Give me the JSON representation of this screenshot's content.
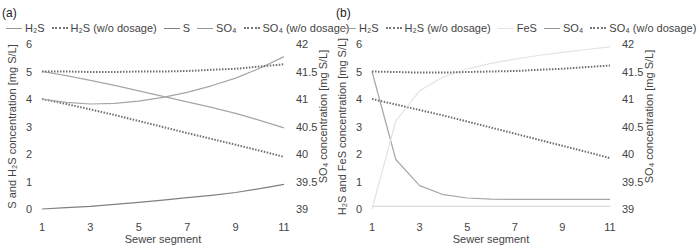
{
  "chart_data": [
    {
      "panel": "(a)",
      "type": "line",
      "legend": [
        "H2S",
        "H2S (w/o dosage)",
        "S",
        "SO4",
        "SO4 (w/o dosage)"
      ],
      "xlabel": "Sewer segment",
      "ylabel_left": "S and H2S concentration [mg S/L]",
      "ylabel_right": "SO4 concentration [mg S/L]",
      "x_ticks": [
        1,
        3,
        5,
        7,
        9,
        11
      ],
      "y_left_ticks": [
        0,
        1,
        2,
        3,
        4,
        5,
        6
      ],
      "y_right_ticks": [
        39,
        39.5,
        40,
        40.5,
        41,
        41.5,
        42
      ],
      "ylim_left": [
        0,
        6
      ],
      "ylim_right": [
        39,
        42
      ],
      "x": [
        1,
        2,
        3,
        4,
        5,
        6,
        7,
        8,
        9,
        10,
        11
      ],
      "series": [
        {
          "name": "H2S",
          "axis": "left",
          "style": "solid",
          "color": "#a6a6a6",
          "values": [
            5.0,
            4.85,
            4.68,
            4.5,
            4.3,
            4.1,
            3.9,
            3.7,
            3.48,
            3.22,
            2.95
          ]
        },
        {
          "name": "H2S (w/o dosage)",
          "axis": "left",
          "style": "dotted",
          "color": "#6e6e6e",
          "values": [
            4.0,
            3.82,
            3.62,
            3.42,
            3.2,
            2.98,
            2.76,
            2.55,
            2.34,
            2.12,
            1.9
          ]
        },
        {
          "name": "S",
          "axis": "left",
          "style": "solid",
          "color": "#7f7f7f",
          "values": [
            0.0,
            0.05,
            0.1,
            0.17,
            0.24,
            0.32,
            0.41,
            0.5,
            0.6,
            0.74,
            0.9
          ]
        },
        {
          "name": "SO4",
          "axis": "right",
          "style": "solid",
          "color": "#a6a6a6",
          "values": [
            41.0,
            40.94,
            40.91,
            40.92,
            40.96,
            41.03,
            41.12,
            41.24,
            41.38,
            41.56,
            41.77
          ]
        },
        {
          "name": "SO4 (w/o dosage)",
          "axis": "right",
          "style": "dotted",
          "color": "#6e6e6e",
          "values": [
            41.5,
            41.5,
            41.49,
            41.49,
            41.5,
            41.5,
            41.51,
            41.53,
            41.55,
            41.59,
            41.63
          ]
        }
      ]
    },
    {
      "panel": "(b)",
      "type": "line",
      "legend": [
        "H2S",
        "H2S (w/o dosage)",
        "FeS",
        "SO4",
        "SO4 (w/o dosage)"
      ],
      "xlabel": "Sewer segment",
      "ylabel_left": "H2S and FeS concentration [mg S/L]",
      "ylabel_right": "SO4 concentration [mg S/L]",
      "x_ticks": [
        1,
        3,
        5,
        7,
        9,
        11
      ],
      "y_left_ticks": [
        0,
        1,
        2,
        3,
        4,
        5,
        6
      ],
      "y_right_ticks": [
        39,
        39.5,
        40,
        40.5,
        41,
        41.5,
        42
      ],
      "ylim_left": [
        0,
        6
      ],
      "ylim_right": [
        39,
        42
      ],
      "x": [
        1,
        2,
        3,
        4,
        5,
        6,
        7,
        8,
        9,
        10,
        11
      ],
      "series": [
        {
          "name": "H2S",
          "axis": "left",
          "style": "solid",
          "color": "#a6a6a6",
          "values": [
            5.0,
            1.8,
            0.85,
            0.52,
            0.4,
            0.36,
            0.35,
            0.35,
            0.35,
            0.35,
            0.35
          ]
        },
        {
          "name": "H2S (w/o dosage)",
          "axis": "left",
          "style": "dotted",
          "color": "#6e6e6e",
          "values": [
            4.0,
            3.8,
            3.6,
            3.4,
            3.18,
            2.96,
            2.74,
            2.52,
            2.3,
            2.08,
            1.85
          ]
        },
        {
          "name": "FeS",
          "axis": "left",
          "style": "solid",
          "color": "#e3e3e3",
          "values": [
            0.0,
            3.2,
            4.3,
            4.8,
            5.1,
            5.3,
            5.45,
            5.58,
            5.7,
            5.8,
            5.9
          ]
        },
        {
          "name": "SO4",
          "axis": "right",
          "style": "solid",
          "color": "#d9d9d9",
          "values": [
            39.05,
            39.05,
            39.05,
            39.05,
            39.05,
            39.05,
            39.05,
            39.05,
            39.05,
            39.05,
            39.05
          ]
        },
        {
          "name": "SO4 (w/o dosage)",
          "axis": "right",
          "style": "dotted",
          "color": "#6e6e6e",
          "values": [
            41.5,
            41.49,
            41.48,
            41.48,
            41.49,
            41.5,
            41.51,
            41.53,
            41.55,
            41.58,
            41.61
          ]
        }
      ]
    }
  ],
  "panels": [
    {
      "label": "(a)",
      "legend": [
        {
          "text": "H₂S",
          "style": "solid"
        },
        {
          "text": "H₂S (w/o dosage)",
          "style": "dotted"
        },
        {
          "text": "S",
          "style": "solid"
        },
        {
          "text": "SO₄",
          "style": "solid"
        },
        {
          "text": "SO₄ (w/o dosage)",
          "style": "dotted"
        }
      ],
      "xlabel": "Sewer segment",
      "ylabel_left": "S and H₂S concentration [mg S/L]",
      "ylabel_right": "SO₄ concentration [mg S/L]"
    },
    {
      "label": "(b)",
      "legend": [
        {
          "text": "H₂S",
          "style": "solid"
        },
        {
          "text": "H₂S (w/o dosage)",
          "style": "dotted"
        },
        {
          "text": "FeS",
          "style": "solid-light"
        },
        {
          "text": "SO₄",
          "style": "solid"
        },
        {
          "text": "SO₄ (w/o dosage)",
          "style": "dotted"
        }
      ],
      "xlabel": "Sewer segment",
      "ylabel_left": "H₂S and FeS concentration [mg S/L]",
      "ylabel_right": "SO₄ concentration [mg S/L]"
    }
  ]
}
